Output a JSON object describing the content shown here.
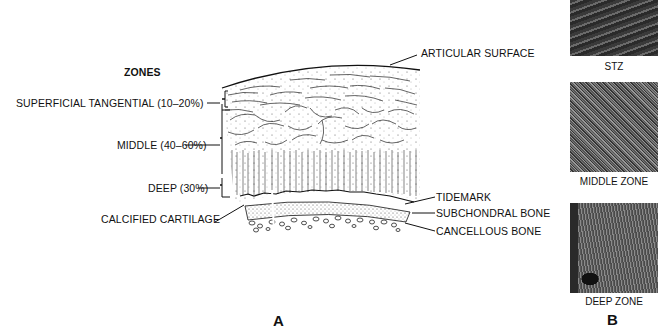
{
  "panel_a": {
    "letter": "A",
    "zones_heading": "ZONES",
    "zone_labels": [
      "SUPERFICIAL TANGENTIAL (10–20%)",
      "MIDDLE (40–60%)",
      "DEEP (30%)"
    ],
    "structure_labels": {
      "articular_surface": "ARTICULAR SURFACE",
      "tidemark": "TIDEMARK",
      "subchondral_bone": "SUBCHONDRAL BONE",
      "cancellous_bone": "CANCELLOUS BONE",
      "calcified_cartilage": "CALCIFIED CARTILAGE"
    }
  },
  "panel_b": {
    "letter": "B",
    "micrographs": [
      {
        "caption": "STZ"
      },
      {
        "caption": "MIDDLE ZONE"
      },
      {
        "caption": "DEEP ZONE"
      }
    ]
  }
}
